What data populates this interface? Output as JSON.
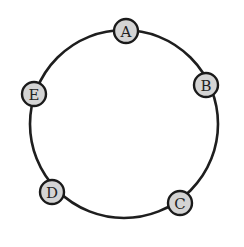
{
  "diagram": {
    "type": "ring-topology",
    "ring": {
      "cx": 124,
      "cy": 124,
      "r": 94
    },
    "node_radius": 12,
    "nodes": [
      {
        "id": "A",
        "label": "A",
        "cx": 126,
        "cy": 31
      },
      {
        "id": "B",
        "label": "B",
        "cx": 206,
        "cy": 85
      },
      {
        "id": "C",
        "label": "C",
        "cx": 180,
        "cy": 203
      },
      {
        "id": "D",
        "label": "D",
        "cx": 52,
        "cy": 192
      },
      {
        "id": "E",
        "label": "E",
        "cx": 34,
        "cy": 94
      }
    ],
    "colors": {
      "node_fill": "#d4d4d4",
      "stroke": "#1e1e1e",
      "background": "#ffffff"
    }
  }
}
